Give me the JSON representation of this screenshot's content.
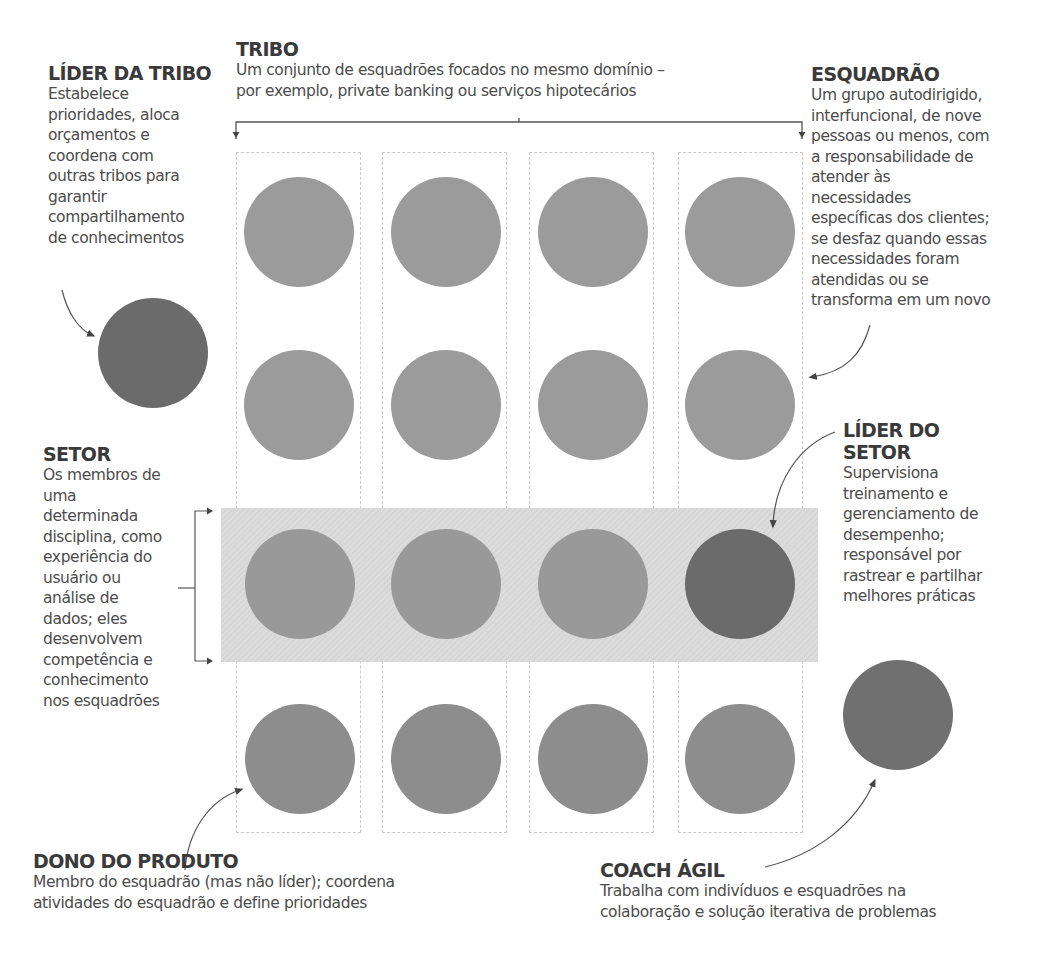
{
  "colors": {
    "member": "#9b9b9b",
    "member_bottom": "#8d8d8d",
    "leader": "#6b6b6b",
    "coach": "#707070",
    "band": "#d9d9d9",
    "dashed_border": "#c8c8c8"
  },
  "tribe": {
    "title": "TRIBO",
    "description": "Um conjunto de esquadrões focados no mesmo domínio –\npor exemplo, private banking ou serviços hipotecários"
  },
  "tribe_leader": {
    "title": "LÍDER DA TRIBO",
    "description": "Estabelece\nprioridades, aloca\norçamentos e\ncoordena com\noutras tribos para\ngarantir\ncompartilhamento\nde conhecimentos"
  },
  "squad": {
    "title": "ESQUADRÃO",
    "description": "Um grupo autodirigido,\ninterfuncional, de nove\npessoas ou menos, com\na responsabilidade de\natender às\nnecessidades\nespecíficas dos clientes;\nse desfaz quando essas\nnecessidades foram\natendidas ou se\ntransforma em um novo"
  },
  "chapter": {
    "title": "SETOR",
    "description": "Os membros de\numa\ndeterminada\ndisciplina, como\nexperiência do\nusuário ou\nanálise de\ndados; eles\ndesenvolvem\ncompetência e\nconhecimento\nnos esquadrões"
  },
  "chapter_leader": {
    "title": "LÍDER DO\nSETOR",
    "description": "Supervisiona\ntreinamento e\ngerenciamento de\ndesempenho;\nresponsável por\nrastrear e partilhar\nmelhores práticas"
  },
  "product_owner": {
    "title": "DONO DO PRODUTO",
    "description": "Membro do esquadrão (mas não líder); coordena\natividades do esquadrão e define prioridades"
  },
  "agile_coach": {
    "title": "COACH ÁGIL",
    "description": "Trabalha com indivíduos e esquadrões na\ncolaboração e solução iterativa de problemas"
  },
  "grid": {
    "columns": 4,
    "rows": 4,
    "highlighted_row": 3,
    "leader_cell": {
      "row": 3,
      "col": 4
    }
  }
}
